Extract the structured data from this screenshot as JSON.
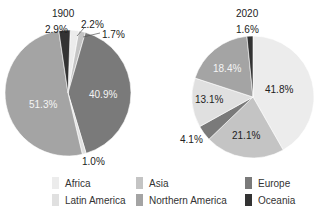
{
  "chart_data": [
    {
      "type": "pie",
      "title": "1900",
      "categories": [
        "Africa",
        "Asia",
        "Europe",
        "Latin America",
        "Northern America",
        "Oceania"
      ],
      "values": [
        2.2,
        1.7,
        40.9,
        1.0,
        51.3,
        2.9
      ],
      "labels": [
        "2.2%",
        "1.7%",
        "40.9%",
        "1.0%",
        "51.3%",
        "2.9%"
      ]
    },
    {
      "type": "pie",
      "title": "2020",
      "categories": [
        "Africa",
        "Asia",
        "Europe",
        "Latin America",
        "Northern America",
        "Oceania"
      ],
      "values": [
        41.8,
        21.1,
        4.1,
        13.1,
        18.4,
        1.6
      ],
      "labels": [
        "41.8%",
        "21.1%",
        "4.1%",
        "13.1%",
        "18.4%",
        "1.6%"
      ]
    }
  ],
  "colors": {
    "Africa": "#ececec",
    "Asia": "#c4c4c4",
    "Europe": "#7a7a7a",
    "Latin America": "#e0e0e0",
    "Northern America": "#a4a4a4",
    "Oceania": "#333333"
  },
  "legend": [
    {
      "label": "Africa",
      "color": "#ececec"
    },
    {
      "label": "Asia",
      "color": "#c4c4c4"
    },
    {
      "label": "Europe",
      "color": "#7a7a7a"
    },
    {
      "label": "Latin America",
      "color": "#e0e0e0"
    },
    {
      "label": "Northern America",
      "color": "#a4a4a4"
    },
    {
      "label": "Oceania",
      "color": "#333333"
    }
  ],
  "titles": {
    "left": "1900",
    "right": "2020"
  }
}
